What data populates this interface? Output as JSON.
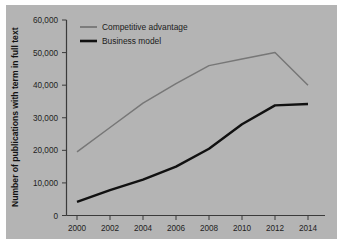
{
  "chart_data": {
    "type": "line",
    "title": "",
    "xlabel": "",
    "ylabel": "Number of publications with term in full text",
    "x": [
      2000,
      2002,
      2004,
      2006,
      2008,
      2010,
      2012,
      2014
    ],
    "xtick_labels": [
      "2000",
      "2002",
      "2004",
      "2006",
      "2008",
      "2010",
      "2012",
      "2014"
    ],
    "ytick_labels": [
      "0",
      "10,000",
      "20,000",
      "30,000",
      "40,000",
      "50,000",
      "60,000"
    ],
    "ytick_values": [
      0,
      10000,
      20000,
      30000,
      40000,
      50000,
      60000
    ],
    "ylim": [
      0,
      60000
    ],
    "xlim": [
      2000,
      2014
    ],
    "grid": false,
    "legend_position": "top-left",
    "series": [
      {
        "name": "Competitive advantage",
        "color": "#777777",
        "values": [
          19500,
          27000,
          34500,
          40500,
          46000,
          48000,
          50000,
          40000
        ]
      },
      {
        "name": "Business model",
        "color": "#111111",
        "values": [
          4200,
          7800,
          11000,
          15000,
          20500,
          28000,
          33800,
          34200
        ]
      }
    ]
  },
  "legend": {
    "items": [
      {
        "label": "Competitive advantage",
        "color": "#777777"
      },
      {
        "label": "Business model",
        "color": "#111111"
      }
    ]
  },
  "axes": {
    "y_title": "Number of publications with term in full text"
  },
  "colors": {
    "plot_background": "#b4b4b4",
    "page_background": "#ffffff",
    "axis": "#3b3b3b",
    "series_competitive": "#777777",
    "series_business": "#111111"
  }
}
